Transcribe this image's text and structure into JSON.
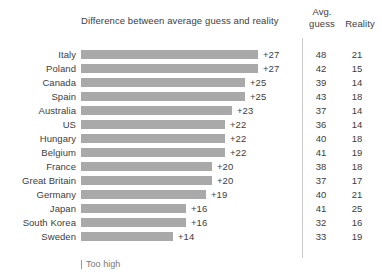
{
  "chart_data": {
    "type": "bar",
    "orientation": "horizontal",
    "title": "Difference between average guess and reality",
    "xlabel": "",
    "ylabel": "",
    "grid": false,
    "legend_position": "bottom-left",
    "xlim": [
      0,
      28
    ],
    "categories": [
      "Italy",
      "Poland",
      "Canada",
      "Spain",
      "Australia",
      "US",
      "Hungary",
      "Belgium",
      "France",
      "Great Britain",
      "Germany",
      "Japan",
      "South Korea",
      "Sweden"
    ],
    "values": [
      27,
      27,
      25,
      25,
      23,
      22,
      22,
      22,
      20,
      20,
      19,
      16,
      16,
      14
    ],
    "value_labels": [
      "+27",
      "+27",
      "+25",
      "+25",
      "+23",
      "+22",
      "+22",
      "+22",
      "+20",
      "+20",
      "+19",
      "+16",
      "+16",
      "+14"
    ],
    "series": [
      {
        "name": "Avg. guess",
        "values": [
          48,
          42,
          39,
          43,
          37,
          36,
          40,
          41,
          38,
          37,
          40,
          41,
          32,
          33
        ]
      },
      {
        "name": "Reality",
        "values": [
          21,
          15,
          14,
          18,
          14,
          14,
          18,
          19,
          18,
          17,
          21,
          25,
          16,
          19
        ]
      }
    ],
    "annotations": [
      "Too high"
    ],
    "bar_color": "#a9a9a9"
  },
  "header": {
    "title": "Difference between average guess and reality",
    "avg_line1": "Avg.",
    "avg_line2": "guess",
    "reality": "Reality"
  },
  "rows": [
    {
      "country": "Italy",
      "value_label": "+27",
      "value": 27,
      "guess": "48",
      "reality": "21"
    },
    {
      "country": "Poland",
      "value_label": "+27",
      "value": 27,
      "guess": "42",
      "reality": "15"
    },
    {
      "country": "Canada",
      "value_label": "+25",
      "value": 25,
      "guess": "39",
      "reality": "14"
    },
    {
      "country": "Spain",
      "value_label": "+25",
      "value": 25,
      "guess": "43",
      "reality": "18"
    },
    {
      "country": "Australia",
      "value_label": "+23",
      "value": 23,
      "guess": "37",
      "reality": "14"
    },
    {
      "country": "US",
      "value_label": "+22",
      "value": 22,
      "guess": "36",
      "reality": "14"
    },
    {
      "country": "Hungary",
      "value_label": "+22",
      "value": 22,
      "guess": "40",
      "reality": "18"
    },
    {
      "country": "Belgium",
      "value_label": "+22",
      "value": 22,
      "guess": "41",
      "reality": "19"
    },
    {
      "country": "France",
      "value_label": "+20",
      "value": 20,
      "guess": "38",
      "reality": "18"
    },
    {
      "country": "Great Britain",
      "value_label": "+20",
      "value": 20,
      "guess": "37",
      "reality": "17"
    },
    {
      "country": "Germany",
      "value_label": "+19",
      "value": 19,
      "guess": "40",
      "reality": "21"
    },
    {
      "country": "Japan",
      "value_label": "+16",
      "value": 16,
      "guess": "41",
      "reality": "25"
    },
    {
      "country": "South Korea",
      "value_label": "+16",
      "value": 16,
      "guess": "32",
      "reality": "16"
    },
    {
      "country": "Sweden",
      "value_label": "+14",
      "value": 14,
      "guess": "33",
      "reality": "19"
    }
  ],
  "legend": {
    "label": "Too high"
  },
  "layout": {
    "bar_origin_x": 81,
    "bar_max_px": 177,
    "value_max": 27,
    "row_pitch": 14,
    "value_label_gap": 5
  }
}
